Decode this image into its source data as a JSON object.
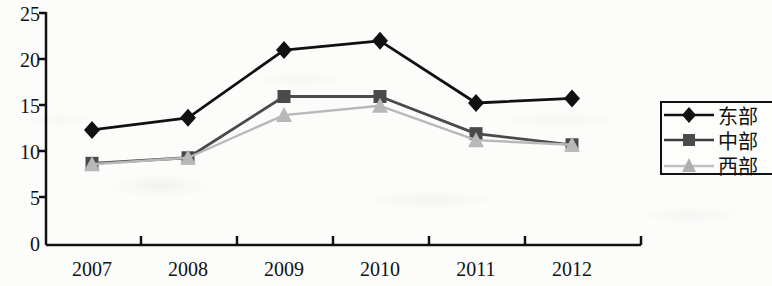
{
  "chart_data": {
    "type": "line",
    "title": "",
    "subtitle": "",
    "xlabel": "",
    "ylabel": "",
    "categories": [
      "2007",
      "2008",
      "2009",
      "2010",
      "2011",
      "2012"
    ],
    "ylim": [
      0,
      25
    ],
    "yticks": [
      0,
      5,
      10,
      15,
      20,
      25
    ],
    "grid": false,
    "legend_position": "right",
    "series": [
      {
        "name": "东部",
        "marker": "diamond",
        "color": "#111111",
        "values": [
          12.4,
          13.7,
          21.0,
          22.0,
          15.3,
          15.8
        ]
      },
      {
        "name": "中部",
        "marker": "square",
        "color": "#4a4a4a",
        "values": [
          8.8,
          9.4,
          16.0,
          16.0,
          12.0,
          10.8
        ]
      },
      {
        "name": "西部",
        "marker": "triangle",
        "color": "#b8b8b8",
        "values": [
          8.7,
          9.4,
          14.0,
          15.0,
          11.3,
          10.8
        ]
      }
    ]
  },
  "axis": {
    "y_tick_labels": [
      "25",
      "20",
      "15",
      "10",
      "5",
      "0"
    ],
    "x_tick_labels": [
      "2007",
      "2008",
      "2009",
      "2010",
      "2011",
      "2012"
    ]
  },
  "legend": {
    "entries": [
      {
        "label": "东部",
        "marker": "diamond",
        "color": "#111111"
      },
      {
        "label": "中部",
        "marker": "square",
        "color": "#4a4a4a"
      },
      {
        "label": "西部",
        "marker": "triangle",
        "color": "#b8b8b8"
      }
    ]
  },
  "colors": {
    "axis": "#111111",
    "east": "#111111",
    "central": "#4a4a4a",
    "west": "#b8b8b8",
    "background": "#fcfcfb"
  }
}
